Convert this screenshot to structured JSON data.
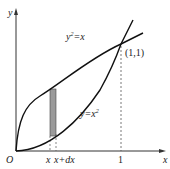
{
  "diagram": {
    "axes": {
      "x_label": "x",
      "y_label": "y",
      "origin_label": "O"
    },
    "curves": [
      {
        "name": "y^2=x",
        "label_base": "y",
        "label_sup": "2",
        "label_rest": "=x"
      },
      {
        "name": "y=x^2",
        "label_base": "y=x",
        "label_sup": "2"
      }
    ],
    "intersection": {
      "label": "(1,1)"
    },
    "ticks": {
      "one": "1",
      "x": "x",
      "x_dx": "x+dx"
    },
    "strip": {
      "fill": "#9a9a9a"
    }
  }
}
